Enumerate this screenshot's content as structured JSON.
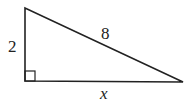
{
  "figure": {
    "type": "right-triangle",
    "labels": {
      "vertical_leg": "2",
      "hypotenuse": "8",
      "horizontal_leg": "x"
    },
    "right_angle_marker": true,
    "stroke_color": "#222222"
  }
}
